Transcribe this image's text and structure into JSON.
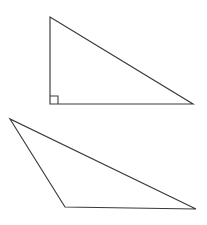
{
  "figure": {
    "title": "Two Triangles Geometry Figure",
    "background_color": "#ffffff",
    "stroke_color": "#3a3a3a",
    "stroke_width": 1.15,
    "width": 207,
    "height": 225,
    "shapes": [
      {
        "id": "upper-triangle",
        "name": "right-triangle",
        "type": "polygon",
        "description": "Right triangle with vertical left leg and horizontal bottom leg",
        "points": "50,17 50,104 193,104",
        "vertices": [
          {
            "label": "apex",
            "x": 50,
            "y": 17
          },
          {
            "label": "bottom-left",
            "x": 50,
            "y": 104
          },
          {
            "label": "bottom-right",
            "x": 193,
            "y": 104
          }
        ],
        "right_angle_at": "bottom-left",
        "angle_marker": {
          "name": "right-angle-square",
          "points": "50,96 58,96 58,104",
          "size": 8
        }
      },
      {
        "id": "lower-triangle",
        "name": "obtuse-scalene-triangle",
        "type": "polygon",
        "description": "Thin scalene triangle with acute vertex at upper left",
        "points": "10,119 65,207 196,209",
        "vertices": [
          {
            "label": "top-left",
            "x": 10,
            "y": 119
          },
          {
            "label": "bottom-left",
            "x": 65,
            "y": 207
          },
          {
            "label": "bottom-right",
            "x": 196,
            "y": 209
          }
        ],
        "right_angle_at": null,
        "angle_marker": null
      }
    ]
  }
}
